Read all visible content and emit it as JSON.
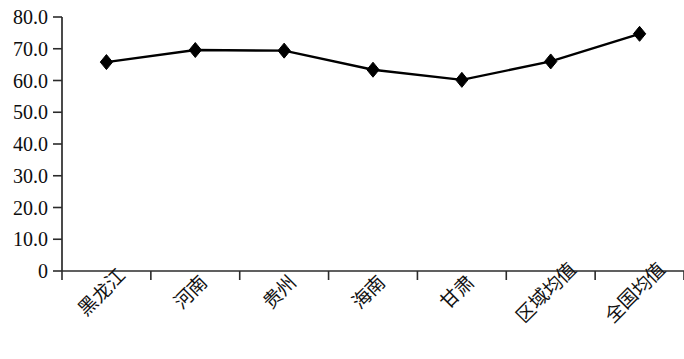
{
  "chart_data": {
    "type": "line",
    "title": "",
    "subtitle": "",
    "xlabel": "",
    "ylabel": "",
    "ylim": [
      0,
      80
    ],
    "grid": false,
    "legend": false,
    "legend_position": "none",
    "marker": "diamond",
    "series_color": "#000000",
    "categories": [
      "黑龙江",
      "河南",
      "贵州",
      "海南",
      "甘肃",
      "区域均值",
      "全国均值"
    ],
    "values": [
      65.8,
      69.6,
      69.4,
      63.4,
      60.2,
      66.0,
      74.7
    ],
    "series": [
      {
        "name": "",
        "values": [
          65.8,
          69.6,
          69.4,
          63.4,
          60.2,
          66.0,
          74.7
        ]
      }
    ],
    "y_ticks": [
      0,
      10,
      20,
      30,
      40,
      50,
      60,
      70,
      80
    ],
    "y_tick_labels": [
      "0",
      "10.0",
      "20.0",
      "30.0",
      "40.0",
      "50.0",
      "60.0",
      "70.0",
      "80.0"
    ],
    "x_tick_labels": [
      "黑龙江",
      "河南",
      "贵州",
      "海南",
      "甘肃",
      "区域均值",
      "全国均值"
    ],
    "x_label_rotation": -45
  }
}
